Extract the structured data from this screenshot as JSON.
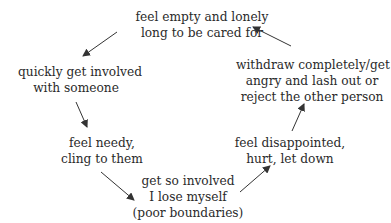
{
  "diagram": {
    "type": "cycle",
    "nodes": [
      {
        "id": "n1",
        "lines": [
          "feel empty and lonely",
          "long to be cared for"
        ]
      },
      {
        "id": "n2",
        "lines": [
          "quickly get involved",
          "with someone"
        ]
      },
      {
        "id": "n3",
        "lines": [
          "feel needy,",
          "cling to them"
        ]
      },
      {
        "id": "n4",
        "lines": [
          "get so involved",
          "I lose myself",
          "(poor boundaries)"
        ]
      },
      {
        "id": "n5",
        "lines": [
          "feel disappointed,",
          "hurt, let down"
        ]
      },
      {
        "id": "n6",
        "lines": [
          "withdraw completely/get",
          "angry and lash out or",
          "reject the other person"
        ]
      }
    ],
    "edges": [
      {
        "from": "n1",
        "to": "n2"
      },
      {
        "from": "n2",
        "to": "n3"
      },
      {
        "from": "n3",
        "to": "n4"
      },
      {
        "from": "n4",
        "to": "n5"
      },
      {
        "from": "n5",
        "to": "n6"
      },
      {
        "from": "n6",
        "to": "n1"
      }
    ],
    "colors": {
      "text": "#2a2a2a",
      "arrow": "#333333",
      "background": "#ffffff"
    }
  }
}
